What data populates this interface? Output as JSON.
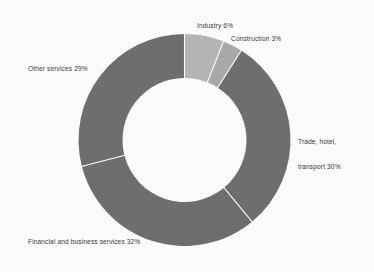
{
  "chart_data": {
    "type": "pie",
    "variant": "donut",
    "title": "",
    "subtitle": "",
    "xlabel": "",
    "ylabel": "",
    "legend_position": "none",
    "grid": false,
    "units": "percent",
    "label_format": "{name} {value}%",
    "start_angle_deg": 0,
    "direction": "clockwise",
    "inner_radius_ratio": 0.585,
    "categories": [
      "Industry",
      "Construction",
      "Trade, hotel, transport",
      "Financial and business services",
      "Other services"
    ],
    "values": [
      6,
      3,
      30,
      32,
      29
    ],
    "slices": [
      {
        "name": "Industry",
        "value": 6,
        "label": "Industry 6%",
        "color": "#b4b4b4",
        "start_pct": 0,
        "end_pct": 6
      },
      {
        "name": "Construction",
        "value": 3,
        "label": "Construction 3%",
        "color": "#a8a8a8",
        "start_pct": 6,
        "end_pct": 9
      },
      {
        "name": "Trade, hotel, transport",
        "value": 30,
        "label_line1": "Trade, hotel,",
        "label_line2": "transport 30%",
        "label": "Trade, hotel, transport 30%",
        "color": "#6e6e6e",
        "start_pct": 9,
        "end_pct": 39
      },
      {
        "name": "Financial and business services",
        "value": 32,
        "label": "Financial and business services 32%",
        "color": "#6e6e6e",
        "start_pct": 39,
        "end_pct": 71
      },
      {
        "name": "Other services",
        "value": 29,
        "label": "Other services 29%",
        "color": "#6e6e6e",
        "start_pct": 71,
        "end_pct": 100
      }
    ],
    "colors": {
      "background": "#fbfbfb",
      "separator": "#fbfbfb",
      "label_text": "#3a3a3a",
      "light_grey": "#b4b4b4",
      "mid_grey": "#a8a8a8",
      "dark_grey": "#6e6e6e"
    }
  },
  "labels": {
    "industry": "Industry 6%",
    "construction": "Construction 3%",
    "trade_line1": "Trade, hotel,",
    "trade_line2": "transport 30%",
    "other_services": "Other services 29%",
    "financial": "Financial and business services 32%"
  }
}
